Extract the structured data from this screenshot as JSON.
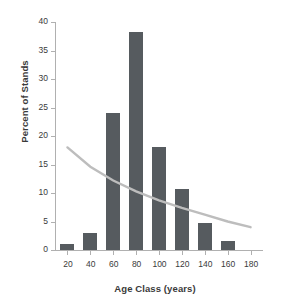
{
  "chart_data": {
    "type": "bar",
    "title": "",
    "xlabel": "Age Class (years)",
    "ylabel": "Percent of Stands",
    "categories": [
      20,
      40,
      60,
      80,
      100,
      120,
      140,
      160
    ],
    "values": [
      1.0,
      2.9,
      24.0,
      38.2,
      18.0,
      10.7,
      4.8,
      1.5
    ],
    "series": [
      {
        "name": "Percent of Stands",
        "type": "bar",
        "values": [
          1.0,
          2.9,
          24.0,
          38.2,
          18.0,
          10.7,
          4.8,
          1.5
        ]
      },
      {
        "name": "trend",
        "type": "line",
        "x": [
          20,
          40,
          60,
          80,
          100,
          120,
          140,
          160,
          180
        ],
        "values": [
          18.0,
          14.6,
          12.2,
          10.3,
          8.7,
          7.4,
          6.2,
          5.0,
          4.0
        ]
      }
    ],
    "xlim": [
      10,
      190
    ],
    "ylim": [
      0,
      40
    ],
    "xticks": [
      20,
      40,
      60,
      80,
      100,
      120,
      140,
      160,
      180
    ],
    "yticks": [
      0,
      5,
      10,
      15,
      20,
      25,
      30,
      35,
      40
    ],
    "xtick_labels": [
      "20",
      "40",
      "60",
      "80",
      "100",
      "120",
      "140",
      "160",
      "180"
    ],
    "ytick_labels": [
      "0",
      "5",
      "10",
      "15",
      "20",
      "25",
      "30",
      "35",
      "40"
    ],
    "grid": false,
    "legend": "none",
    "bar_color": "#565b5f",
    "line_color": "#bdbdbd",
    "axis_color": "#b0b0b0",
    "text_color": "#3a3a3a",
    "bar_width": 14
  }
}
